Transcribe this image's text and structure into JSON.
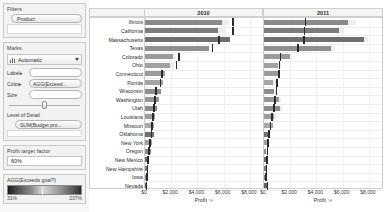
{
  "sidebar": {
    "filters": {
      "title": "Filters",
      "pills": [
        "Product"
      ]
    },
    "marks": {
      "title": "Marks",
      "mark_type": "Automatic",
      "mark_type_icon": "bar-chart-icon",
      "dropdown_icon": "chevron-down-icon",
      "rows": [
        {
          "label": "Label",
          "value": "",
          "icon": "label-card-icon"
        },
        {
          "label": "Color",
          "value": "AGG(Exceed...",
          "icon": "color-card-icon"
        },
        {
          "label": "Size",
          "value": "",
          "icon": "size-card-icon"
        }
      ]
    },
    "level_of_detail": {
      "title": "Level of Detail",
      "pill": "SUM(Budget pro..."
    },
    "parameter": {
      "title": "Profit target factor",
      "value": "60%"
    },
    "legend": {
      "title": "AGG(Exceeds goal?)",
      "min": "31%",
      "max": "237%"
    }
  },
  "chart": {
    "columns": [
      "2010",
      "2011"
    ],
    "axis_caption": "Profit",
    "axis_sort_icon": "sort-ascending-icon"
  },
  "chart_data": {
    "type": "bar",
    "xlabel": "Profit",
    "ylabel": "",
    "xlim": [
      0,
      9000
    ],
    "xticks": [
      0,
      2000,
      4000,
      6000,
      8000
    ],
    "xticklabels": [
      "$0",
      "$2,000",
      "$4,000",
      "$6,000",
      "$8,000"
    ],
    "grid": true,
    "legend": "AGG(Exceeds goal?) color ramp 31% to 237%",
    "categories": [
      "Illinois",
      "California",
      "Massachusetts",
      "Texas",
      "Colorado",
      "Ohio",
      "Connecticut",
      "Florida",
      "Wisconsin",
      "Washington",
      "Utah",
      "Louisiana",
      "Missouri",
      "Oklahoma",
      "New York",
      "Oregon",
      "New Mexico",
      "New Hampshire",
      "Iowa",
      "Nevada"
    ],
    "series": [
      {
        "name": "2010 Profit",
        "panel": "2010",
        "values": [
          5900,
          5600,
          6500,
          4900,
          2100,
          1900,
          1500,
          1400,
          1250,
          1100,
          900,
          800,
          700,
          650,
          520,
          420,
          260,
          180,
          150,
          120
        ]
      },
      {
        "name": "2010 Budget reference",
        "panel": "2010",
        "type": "reference-line",
        "values": [
          6650,
          6650,
          5600,
          5100,
          2550,
          2350,
          1250,
          1150,
          780,
          700,
          640,
          560,
          470,
          420,
          340,
          260,
          170,
          120,
          90,
          60
        ]
      },
      {
        "name": "2010 Band (budget range)",
        "panel": "2010",
        "type": "band",
        "values": [
          6400,
          6150,
          5300,
          4700,
          2400,
          2200,
          1150,
          1050,
          700,
          620,
          570,
          500,
          420,
          370,
          300,
          230,
          150,
          100,
          80,
          55
        ]
      },
      {
        "name": "2011 Profit",
        "panel": "2011",
        "values": [
          6400,
          5700,
          7600,
          5100,
          1950,
          1100,
          1050,
          700,
          780,
          1150,
          1250,
          780,
          650,
          450,
          230,
          140,
          210,
          170,
          120,
          240
        ]
      },
      {
        "name": "2011 Budget reference",
        "panel": "2011",
        "type": "reference-line",
        "values": [
          3100,
          3050,
          3000,
          2550,
          1200,
          1150,
          1100,
          950,
          900,
          800,
          700,
          560,
          450,
          330,
          260,
          200,
          170,
          140,
          110,
          200
        ]
      },
      {
        "name": "2011 Band (budget range)",
        "panel": "2011",
        "type": "band",
        "values": [
          7000,
          6100,
          7900,
          5400,
          2150,
          1300,
          1250,
          900,
          950,
          1300,
          1400,
          900,
          760,
          560,
          320,
          220,
          260,
          210,
          160,
          300
        ]
      }
    ]
  }
}
